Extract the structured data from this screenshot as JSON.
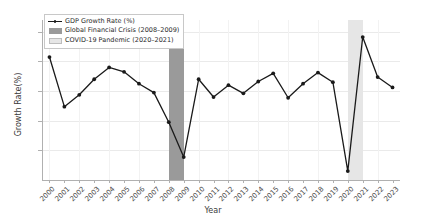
{
  "chart_data": {
    "type": "line",
    "title": "",
    "xlabel": "Year",
    "ylabel": "Growth Rate(%)",
    "categories": [
      "2000",
      "2001",
      "2002",
      "2003",
      "2004",
      "2005",
      "2006",
      "2007",
      "2008",
      "2009",
      "2010",
      "2011",
      "2012",
      "2013",
      "2014",
      "2015",
      "2016",
      "2017",
      "2018",
      "2019",
      "2020",
      "2021",
      "2022",
      "2023"
    ],
    "series": [
      {
        "name": "GDP Growth Rate (%)",
        "color": "#1a1a1a",
        "marker": "circle",
        "values": [
          4.3,
          0.95,
          1.75,
          2.8,
          3.6,
          3.3,
          2.5,
          1.9,
          -0.1,
          -2.45,
          2.8,
          1.6,
          2.4,
          1.85,
          2.65,
          3.2,
          1.55,
          2.5,
          3.25,
          2.6,
          -3.4,
          5.65,
          2.95,
          2.25
        ]
      }
    ],
    "ylim": [
      -4.0,
      6.8
    ],
    "yticks": [
      6,
      4,
      2,
      0,
      -2
    ],
    "ytick_labels": [
      "6",
      "4",
      "2",
      "0",
      "−2"
    ],
    "grid": true,
    "legend_position": "upper left",
    "bands": [
      {
        "name": "Global Financial Crisis (2008-2009)",
        "label": "Global Financial Crisis (2008–2009)",
        "start": "2008",
        "end": "2009",
        "color": "#9a9a9a"
      },
      {
        "name": "COVID-19 Pandemic (2020-2021)",
        "label": "COVID-19 Pandemic (2020–2021)",
        "start": "2020",
        "end": "2021",
        "color": "#e6e6e6"
      }
    ],
    "legend": [
      {
        "label": "GDP Growth Rate (%)",
        "key": "line"
      },
      {
        "label": "Global Financial Crisis (2008–2009)",
        "key": "swatch",
        "color": "#9a9a9a"
      },
      {
        "label": "COVID-19 Pandemic (2020–2021)",
        "key": "swatch",
        "color": "#e6e6e6"
      }
    ]
  }
}
